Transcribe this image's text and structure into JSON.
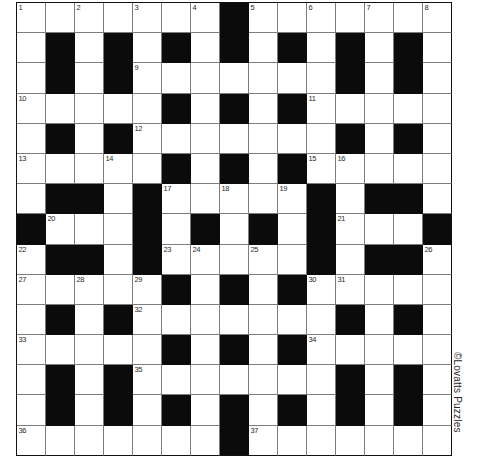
{
  "puzzle": {
    "type": "crossword-grid",
    "title": "Crossword Puzzle Grid",
    "columns": 15,
    "rows": 15,
    "colors": {
      "block": "#0b0b0b",
      "open": "#ffffff",
      "gridline": "#7d7d7d",
      "border": "#111111",
      "number_text": "#2a2a2a"
    },
    "blocks": [
      [
        7
      ],
      [
        1,
        3,
        5,
        7,
        9,
        11,
        13
      ],
      [
        1,
        3,
        11,
        13
      ],
      [
        5,
        7,
        9
      ],
      [
        1,
        3,
        11,
        13
      ],
      [
        5,
        7,
        9
      ],
      [
        1,
        2,
        4,
        10,
        12,
        13
      ],
      [
        0,
        4,
        6,
        8,
        10,
        14
      ],
      [
        1,
        2,
        4,
        10,
        12,
        13
      ],
      [
        5,
        7,
        9
      ],
      [
        1,
        3,
        11,
        13
      ],
      [
        5,
        7,
        9
      ],
      [
        1,
        3,
        11,
        13
      ],
      [
        1,
        3,
        5,
        7,
        9,
        11,
        13
      ],
      [
        7
      ]
    ],
    "numbers": [
      {
        "n": "1",
        "row": 0,
        "col": 0
      },
      {
        "n": "2",
        "row": 0,
        "col": 2
      },
      {
        "n": "3",
        "row": 0,
        "col": 4
      },
      {
        "n": "4",
        "row": 0,
        "col": 6
      },
      {
        "n": "5",
        "row": 0,
        "col": 8
      },
      {
        "n": "6",
        "row": 0,
        "col": 10
      },
      {
        "n": "7",
        "row": 0,
        "col": 12
      },
      {
        "n": "8",
        "row": 0,
        "col": 14
      },
      {
        "n": "9",
        "row": 2,
        "col": 4
      },
      {
        "n": "10",
        "row": 3,
        "col": 0
      },
      {
        "n": "11",
        "row": 3,
        "col": 10
      },
      {
        "n": "12",
        "row": 4,
        "col": 4
      },
      {
        "n": "13",
        "row": 5,
        "col": 0
      },
      {
        "n": "14",
        "row": 5,
        "col": 3
      },
      {
        "n": "15",
        "row": 5,
        "col": 10
      },
      {
        "n": "16",
        "row": 5,
        "col": 11
      },
      {
        "n": "17",
        "row": 6,
        "col": 5
      },
      {
        "n": "18",
        "row": 6,
        "col": 7
      },
      {
        "n": "19",
        "row": 6,
        "col": 9
      },
      {
        "n": "20",
        "row": 7,
        "col": 1
      },
      {
        "n": "21",
        "row": 7,
        "col": 11
      },
      {
        "n": "22",
        "row": 8,
        "col": 0
      },
      {
        "n": "23",
        "row": 8,
        "col": 5
      },
      {
        "n": "24",
        "row": 8,
        "col": 6
      },
      {
        "n": "25",
        "row": 8,
        "col": 8
      },
      {
        "n": "26",
        "row": 8,
        "col": 14
      },
      {
        "n": "27",
        "row": 9,
        "col": 0
      },
      {
        "n": "28",
        "row": 9,
        "col": 2
      },
      {
        "n": "29",
        "row": 9,
        "col": 4
      },
      {
        "n": "30",
        "row": 9,
        "col": 10
      },
      {
        "n": "31",
        "row": 9,
        "col": 11
      },
      {
        "n": "32",
        "row": 10,
        "col": 4
      },
      {
        "n": "33",
        "row": 11,
        "col": 0
      },
      {
        "n": "34",
        "row": 11,
        "col": 10
      },
      {
        "n": "35",
        "row": 12,
        "col": 4
      },
      {
        "n": "36",
        "row": 14,
        "col": 0
      },
      {
        "n": "37",
        "row": 14,
        "col": 8
      }
    ]
  },
  "copyright": {
    "text": "©Lovatts Puzzles"
  }
}
